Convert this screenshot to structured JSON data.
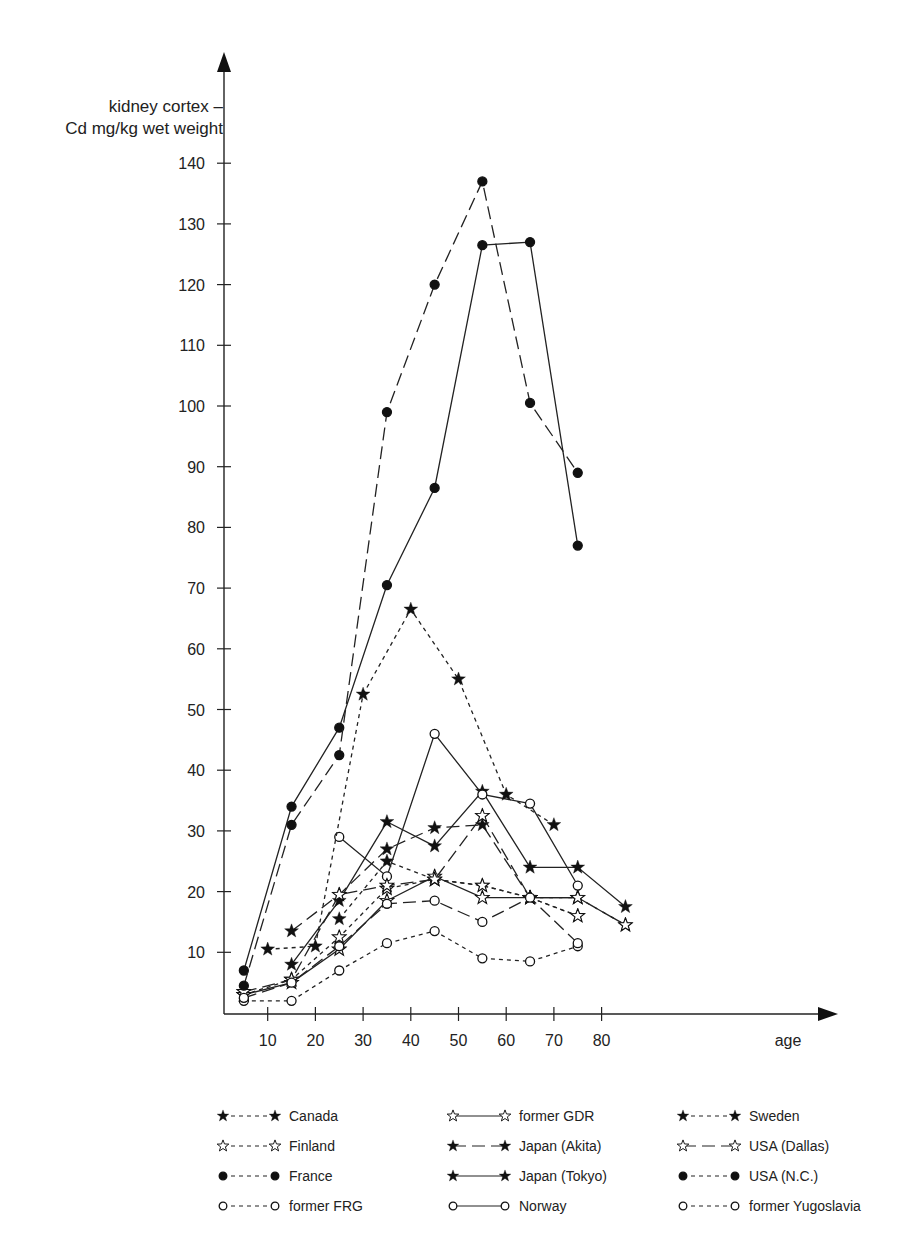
{
  "chart_data": {
    "type": "line",
    "title": "",
    "ylabel": "kidney cortex – Cd mg/kg wet weight",
    "xlabel": "age",
    "ylabel_lines": [
      "kidney cortex –",
      "Cd mg/kg wet weight"
    ],
    "xlim": [
      0,
      92
    ],
    "ylim": [
      0,
      145
    ],
    "xticks": [
      10,
      20,
      30,
      40,
      50,
      60,
      70,
      80
    ],
    "yticks": [
      10,
      20,
      30,
      40,
      50,
      60,
      70,
      80,
      90,
      100,
      110,
      120,
      130,
      140
    ],
    "grid": false,
    "legend_position": "bottom",
    "series": [
      {
        "name": "Canada",
        "marker": "star-filled",
        "line": "short-dash",
        "points": [
          [
            25,
            15.5
          ],
          [
            35,
            25
          ],
          [
            45,
            22
          ],
          [
            55,
            21
          ],
          [
            65,
            19
          ],
          [
            75,
            16
          ]
        ]
      },
      {
        "name": "Finland",
        "marker": "star-open",
        "line": "short-dash",
        "points": [
          [
            5,
            3
          ],
          [
            15,
            5.5
          ],
          [
            25,
            12.5
          ],
          [
            35,
            20.5
          ],
          [
            45,
            22
          ],
          [
            55,
            21
          ],
          [
            65,
            19
          ],
          [
            75,
            16
          ]
        ]
      },
      {
        "name": "France",
        "marker": "dot-filled",
        "line": "solid",
        "points": [
          [
            5,
            7
          ],
          [
            15,
            34
          ],
          [
            25,
            47
          ],
          [
            35,
            70.5
          ],
          [
            45,
            86.5
          ],
          [
            55,
            126.5
          ],
          [
            65,
            127
          ],
          [
            75,
            77
          ]
        ]
      },
      {
        "name": "former FRG",
        "marker": "dot-open",
        "line": "short-dash",
        "points": [
          [
            5,
            2
          ],
          [
            15,
            2
          ],
          [
            25,
            7
          ],
          [
            35,
            11.5
          ],
          [
            45,
            13.5
          ],
          [
            55,
            9
          ],
          [
            65,
            8.5
          ],
          [
            75,
            11
          ]
        ]
      },
      {
        "name": "former GDR",
        "marker": "star-open",
        "line": "solid",
        "points": [
          [
            5,
            3
          ],
          [
            15,
            5
          ],
          [
            25,
            10.5
          ],
          [
            35,
            18.5
          ],
          [
            45,
            22.5
          ],
          [
            55,
            19
          ],
          [
            65,
            19
          ],
          [
            75,
            19
          ]
        ]
      },
      {
        "name": "Japan (Akita)",
        "marker": "star-filled",
        "line": "long-dash",
        "points": [
          [
            15,
            13.5
          ],
          [
            25,
            19.5
          ],
          [
            35,
            27
          ],
          [
            45,
            30.5
          ],
          [
            55,
            31
          ],
          [
            65,
            19
          ],
          [
            75,
            19
          ],
          [
            85,
            14.5
          ]
        ]
      },
      {
        "name": "Japan (Tokyo)",
        "marker": "star-filled",
        "line": "solid",
        "points": [
          [
            15,
            8
          ],
          [
            25,
            18.5
          ],
          [
            35,
            31.5
          ],
          [
            45,
            27.5
          ],
          [
            55,
            36.5
          ],
          [
            65,
            24
          ],
          [
            75,
            24
          ],
          [
            85,
            17.5
          ]
        ]
      },
      {
        "name": "Norway",
        "marker": "dot-open",
        "line": "solid",
        "points": [
          [
            25,
            29
          ],
          [
            35,
            22.5
          ],
          [
            45,
            46
          ],
          [
            55,
            36
          ],
          [
            65,
            34.5
          ],
          [
            75,
            21
          ]
        ]
      },
      {
        "name": "Sweden",
        "marker": "star-filled",
        "line": "short-dash",
        "points": [
          [
            10,
            10.5
          ],
          [
            20,
            11
          ],
          [
            30,
            52.5
          ],
          [
            40,
            66.5
          ],
          [
            50,
            55
          ],
          [
            60,
            36
          ],
          [
            70,
            31
          ]
        ]
      },
      {
        "name": "USA (Dallas)",
        "marker": "star-open",
        "line": "long-dash",
        "points": [
          [
            5,
            3.5
          ],
          [
            15,
            5.5
          ],
          [
            25,
            19.5
          ],
          [
            35,
            21
          ],
          [
            45,
            22
          ],
          [
            55,
            32.5
          ],
          [
            65,
            19
          ],
          [
            75,
            19
          ],
          [
            85,
            14.5
          ]
        ]
      },
      {
        "name": "USA (N.C.)",
        "marker": "dot-filled",
        "line": "long-dash",
        "points": [
          [
            5,
            4.5
          ],
          [
            15,
            31
          ],
          [
            25,
            42.5
          ],
          [
            35,
            99
          ],
          [
            45,
            120
          ],
          [
            55,
            137
          ],
          [
            65,
            100.5
          ],
          [
            75,
            89
          ]
        ]
      },
      {
        "name": "former Yugoslavia",
        "marker": "dot-open",
        "line": "long-dash",
        "points": [
          [
            5,
            2.5
          ],
          [
            15,
            5
          ],
          [
            25,
            11
          ],
          [
            35,
            18
          ],
          [
            45,
            18.5
          ],
          [
            55,
            15
          ],
          [
            65,
            19
          ],
          [
            75,
            11.5
          ]
        ]
      }
    ]
  },
  "axis": {
    "x_label": "age",
    "y_label_1": "kidney cortex –",
    "y_label_2": "Cd mg/kg wet weight"
  },
  "legend": [
    {
      "label": "Canada",
      "marker": "star-filled",
      "line": "short-dash"
    },
    {
      "label": "former GDR",
      "marker": "star-open",
      "line": "solid"
    },
    {
      "label": "Sweden",
      "marker": "star-filled",
      "line": "short-dash"
    },
    {
      "label": "Finland",
      "marker": "star-open",
      "line": "short-dash"
    },
    {
      "label": "Japan (Akita)",
      "marker": "star-filled",
      "line": "long-dash"
    },
    {
      "label": "USA (Dallas)",
      "marker": "star-open",
      "line": "long-dash"
    },
    {
      "label": "France",
      "marker": "dot-filled",
      "line": "short-dash"
    },
    {
      "label": "Japan (Tokyo)",
      "marker": "star-filled",
      "line": "solid"
    },
    {
      "label": "USA (N.C.)",
      "marker": "dot-filled",
      "line": "short-dash"
    },
    {
      "label": "former FRG",
      "marker": "dot-open",
      "line": "short-dash"
    },
    {
      "label": "Norway",
      "marker": "dot-open",
      "line": "solid"
    },
    {
      "label": "former Yugoslavia",
      "marker": "dot-open",
      "line": "short-dash"
    }
  ]
}
